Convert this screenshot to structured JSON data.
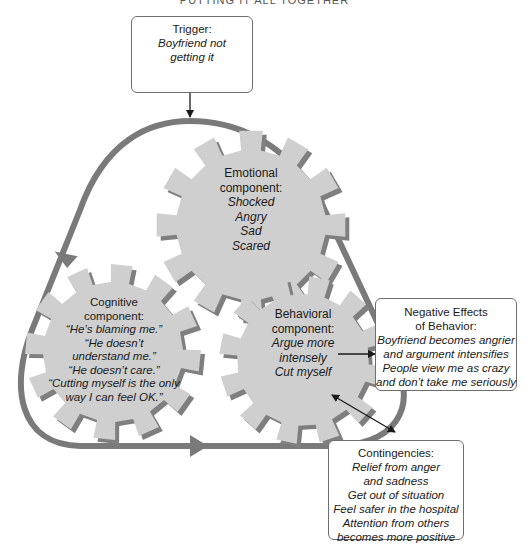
{
  "running_header": "PUTTING IT ALL TOGETHER",
  "colors": {
    "loop": "#7a7a7a",
    "gear_face": "#cfcfcf",
    "gear_shadow": "#7f7f7f",
    "box_border": "#6e6e6e",
    "arrow": "#1a1a1a"
  },
  "trigger": {
    "title": "Trigger:",
    "lines": [
      "Boyfriend not",
      "getting it"
    ]
  },
  "gears": {
    "emotional": {
      "title_1": "Emotional",
      "title_2": "component:",
      "lines": [
        "Shocked",
        "Angry",
        "Sad",
        "Scared"
      ]
    },
    "cognitive": {
      "title_1": "Cognitive",
      "title_2": "component:",
      "lines": [
        "“He’s blaming me.”",
        "“He doesn’t",
        "understand me.”",
        "“He doesn’t care.”",
        "“Cutting myself is the only",
        "way I can feel OK.”"
      ]
    },
    "behavioral": {
      "title_1": "Behavioral",
      "title_2": "component:",
      "lines": [
        "Argue more",
        "intensely",
        "Cut myself"
      ]
    }
  },
  "negative_effects": {
    "title_1": "Negative Effects",
    "title_2": "of Behavior:",
    "lines": [
      "Boyfriend becomes angrier",
      "and argument intensifies",
      "People view me as crazy",
      "and don’t take me seriously"
    ]
  },
  "contingencies": {
    "title": "Contingencies:",
    "lines": [
      "Relief from anger",
      "and sadness",
      "Get out of situation",
      "Feel safer in the hospital",
      "Attention from others",
      "becomes more positive"
    ]
  }
}
